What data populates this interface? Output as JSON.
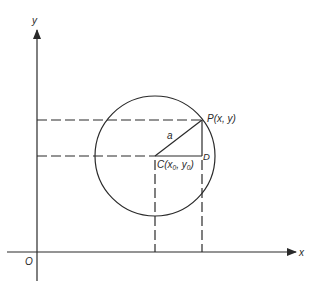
{
  "diagram": {
    "axes": {
      "x_label": "x",
      "y_label": "y",
      "origin_label": "O"
    },
    "points": {
      "P": {
        "label": "P(x, y)"
      },
      "C": {
        "label_prefix": "C(",
        "x0_base": "x",
        "x0_sub": "0",
        "sep": ", ",
        "y0_base": "y",
        "y0_sub": "0",
        "label_suffix": ")"
      },
      "D": {
        "label": "D"
      }
    },
    "radius_label": "a",
    "colors": {
      "stroke": "#2a2a2a",
      "background": "#ffffff"
    }
  }
}
